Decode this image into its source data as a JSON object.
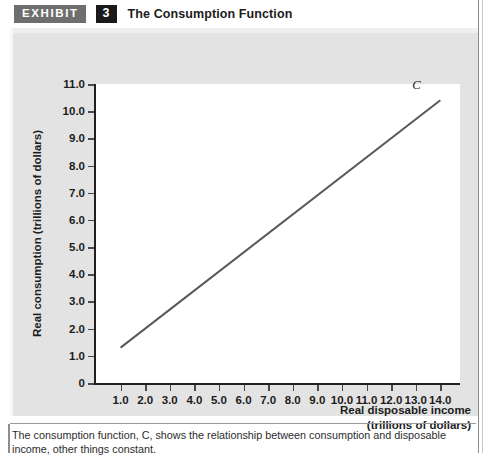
{
  "header": {
    "badge_label": "EXHIBIT",
    "number": "3",
    "title": "The Consumption Function"
  },
  "caption": {
    "line1": "The consumption function, C, shows the relationship between consumption and disposable income, other",
    "line2": "things constant."
  },
  "chart_data": {
    "type": "line",
    "title": "The Consumption Function",
    "xlabel_line1": "Real disposable income",
    "xlabel_line2": "(trillions of dollars)",
    "ylabel": "Real consumption (trillions of dollars)",
    "xlim": [
      0,
      14.8
    ],
    "ylim": [
      0,
      11.0
    ],
    "grid": false,
    "legend": "none",
    "x_ticks": [
      "1.0",
      "2.0",
      "3.0",
      "4.0",
      "5.0",
      "6.0",
      "7.0",
      "8.0",
      "9.0",
      "10.0",
      "11.0",
      "12.0",
      "13.0",
      "14.0"
    ],
    "x_tick_values": [
      1,
      2,
      3,
      4,
      5,
      6,
      7,
      8,
      9,
      10,
      11,
      12,
      13,
      14
    ],
    "y_ticks": [
      "0",
      "1.0",
      "2.0",
      "3.0",
      "4.0",
      "5.0",
      "6.0",
      "7.0",
      "8.0",
      "9.0",
      "10.0",
      "11.0"
    ],
    "y_tick_values": [
      0,
      1,
      2,
      3,
      4,
      5,
      6,
      7,
      8,
      9,
      10,
      11
    ],
    "series": [
      {
        "name": "C",
        "annotation": "C",
        "color": "#595959",
        "x": [
          1.0,
          14.0
        ],
        "y": [
          1.3,
          10.4
        ]
      }
    ]
  },
  "colors": {
    "panel": "#e3e3e3",
    "plot_bg": "#ffffff",
    "axis": "#231f20",
    "line": "#595959",
    "badge_exhibit_bg": "#6e6e6e",
    "badge_number_bg": "#1a1a1a"
  }
}
